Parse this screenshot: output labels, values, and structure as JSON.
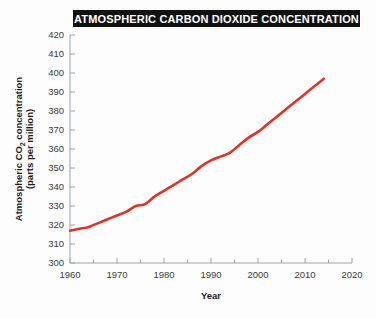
{
  "chart_data": {
    "type": "line",
    "title": "ATMOSPHERIC CARBON DIOXIDE CONCENTRATION",
    "xlabel": "Year",
    "ylabel_line1": "Atmospheric CO",
    "ylabel_sub": "2",
    "ylabel_line1_tail": " concentration",
    "ylabel_line2": "(parts per million)",
    "ylabel_full": "Atmospheric CO2 concentration (parts per million)",
    "xlim": [
      1960,
      2020
    ],
    "ylim": [
      300,
      420
    ],
    "xticks": [
      1960,
      1970,
      1980,
      1990,
      2000,
      2010,
      2020
    ],
    "xtick_labels": [
      "1960",
      "1970",
      "1980",
      "1990",
      "2000",
      "2010",
      "2020"
    ],
    "x_minor_ticks": [
      1965,
      1975,
      1985,
      1995,
      2005,
      2015
    ],
    "yticks": [
      300,
      310,
      320,
      330,
      340,
      350,
      360,
      370,
      380,
      390,
      400,
      410,
      420
    ],
    "ytick_labels": [
      "300",
      "310",
      "320",
      "330",
      "340",
      "350",
      "360",
      "370",
      "380",
      "390",
      "400",
      "410",
      "420"
    ],
    "grid": false,
    "legend": null,
    "line_color": "#e03325",
    "axis_color": "#9aa4ad",
    "title_background": "#111111",
    "title_color": "#ffffff",
    "series": [
      {
        "name": "Atmospheric CO2 concentration",
        "x": [
          1960,
          1962,
          1964,
          1966,
          1968,
          1970,
          1972,
          1974,
          1976,
          1978,
          1980,
          1982,
          1984,
          1986,
          1988,
          1990,
          1992,
          1994,
          1996,
          1998,
          2000,
          2002,
          2004,
          2006,
          2008,
          2010,
          2012,
          2014
        ],
        "values": [
          317,
          318,
          319,
          321,
          323,
          325,
          327,
          330,
          331,
          335,
          338,
          341,
          344,
          347,
          351,
          354,
          356,
          358,
          362,
          366,
          369,
          373,
          377,
          381,
          385,
          389,
          393,
          397
        ]
      }
    ]
  }
}
